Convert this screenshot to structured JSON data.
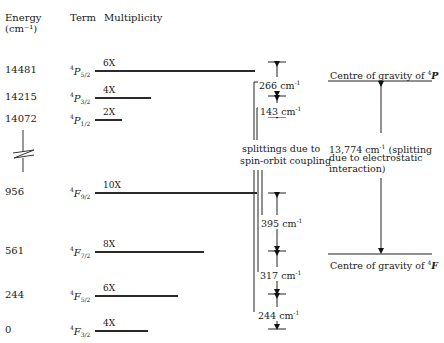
{
  "headers": {
    "energy": "Energy",
    "energy_unit": "(cm⁻¹)",
    "term": "Term",
    "multiplicity": "Multiplicity"
  },
  "levels": [
    {
      "energy": "14481",
      "term": "P",
      "j": "5/2",
      "mult": "6X",
      "y": 70,
      "len": 160
    },
    {
      "energy": "14215",
      "term": "P",
      "j": "3/2",
      "mult": "4X",
      "y": 97,
      "len": 56
    },
    {
      "energy": "14072",
      "term": "P",
      "j": "1/2",
      "mult": "2X",
      "y": 119,
      "len": 27
    },
    {
      "energy": "956",
      "term": "F",
      "j": "9/2",
      "mult": "10X",
      "y": 192,
      "len": 162
    },
    {
      "energy": "561",
      "term": "F",
      "j": "7/2",
      "mult": "8X",
      "y": 251,
      "len": 109
    },
    {
      "energy": "244",
      "term": "F",
      "j": "5/2",
      "mult": "6X",
      "y": 295,
      "len": 83
    },
    {
      "energy": "0",
      "term": "F",
      "j": "3/2",
      "mult": "4X",
      "y": 330,
      "len": 53
    }
  ],
  "term_superscript": "4",
  "splittings": [
    {
      "value": "266 cm",
      "unit_exp": "-1",
      "y": 82
    },
    {
      "value": "143 cm",
      "unit_exp": "-1",
      "y": 108
    },
    {
      "value": "395 cm",
      "unit_exp": "-1",
      "y": 220
    },
    {
      "value": "317 cm",
      "unit_exp": "-1",
      "y": 272
    },
    {
      "value": "244 cm",
      "unit_exp": "-1",
      "y": 312
    }
  ],
  "spin_orbit_note": {
    "line1": "splittings due to",
    "line2": "spin-orbit coupling"
  },
  "centre_P": {
    "text": "Centre of gravity of ",
    "sup": "4",
    "term": "P"
  },
  "centre_F": {
    "text": "Centre of gravity of ",
    "sup": "4",
    "term": "F"
  },
  "electrostatic_note": {
    "line1_value": "13,774 cm",
    "line1_exp": "-1",
    "line1_rest": " (splitting",
    "line2": "due to electrostatic",
    "line3": "interaction)"
  }
}
